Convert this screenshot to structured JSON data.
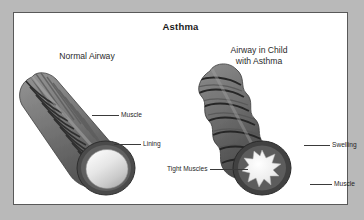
{
  "figure": {
    "title": "Asthma",
    "border_color": "#595959",
    "background_color": "#ffffff",
    "outer_background_color": "#b9b9b9"
  },
  "panels": {
    "normal": {
      "heading": "Normal Airway",
      "airway_color": "#7d7d7d",
      "muscle_band_color": "#3c3c3c",
      "lumen_color": "#efefef",
      "lumen_shape": "wide-open-circle"
    },
    "asthma": {
      "heading_line1": "Airway in Child",
      "heading_line2": "with Asthma",
      "airway_color": "#6f6f6f",
      "muscle_band_color": "#333333",
      "lumen_color": "#f2f2f2",
      "lumen_shape": "narrow-star"
    }
  },
  "callouts": [
    {
      "id": "muscle-left",
      "label": "Muscle"
    },
    {
      "id": "lining",
      "label": "Lining"
    },
    {
      "id": "tight-muscles",
      "label": "Tight Muscles"
    },
    {
      "id": "swelling",
      "label": "Swelling"
    },
    {
      "id": "muscle-right",
      "label": "Muscle"
    }
  ]
}
